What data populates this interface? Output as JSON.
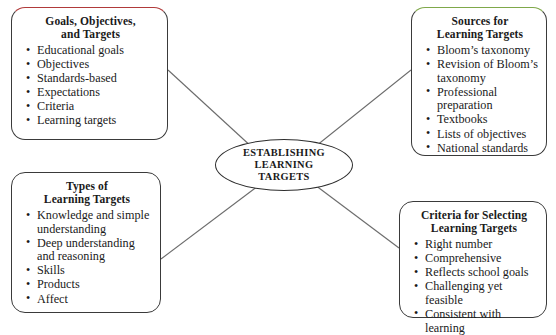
{
  "diagram": {
    "type": "concept-map",
    "hub": {
      "name": "establishing-learning-targets",
      "lines": [
        "ESTABLISHING",
        "LEARNING",
        "TARGETS"
      ]
    },
    "accent_colors": {
      "red": "#b03a3a",
      "green": "#7fa84a",
      "outline": "#3a3a3a"
    },
    "nodes": [
      {
        "id": "goals",
        "title_lines": [
          "Goals, Objectives,",
          "and Targets"
        ],
        "accent": "red",
        "items": [
          "Educational goals",
          "Objectives",
          "Standards-based",
          "Expectations",
          "Criteria",
          "Learning targets"
        ]
      },
      {
        "id": "sources",
        "title_lines": [
          "Sources for",
          "Learning Targets"
        ],
        "accent": "green",
        "items": [
          "Bloom’s taxonomy",
          "Revision of Bloom’s taxonomy",
          "Professional preparation",
          "Textbooks",
          "Lists of objectives",
          "National standards"
        ]
      },
      {
        "id": "types",
        "title_lines": [
          "Types of",
          "Learning Targets"
        ],
        "accent": "none",
        "items": [
          "Knowledge and simple understanding",
          "Deep understanding and reasoning",
          "Skills",
          "Products",
          "Affect"
        ]
      },
      {
        "id": "criteria",
        "title_lines": [
          "Criteria for Selecting",
          "Learning Targets"
        ],
        "accent": "none",
        "items": [
          "Right number",
          "Comprehensive",
          "Reflects school goals",
          "Challenging yet feasible",
          "Consistent with learning"
        ]
      }
    ],
    "connectors": [
      {
        "from": "goals",
        "to": "hub"
      },
      {
        "from": "sources",
        "to": "hub"
      },
      {
        "from": "types",
        "to": "hub"
      },
      {
        "from": "criteria",
        "to": "hub"
      }
    ]
  }
}
